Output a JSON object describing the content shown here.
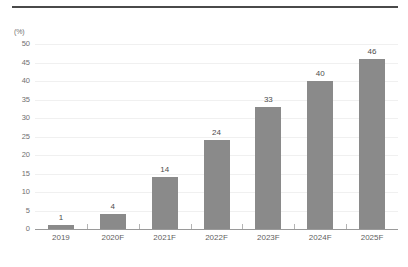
{
  "chart_data": {
    "type": "bar",
    "title": "",
    "subtitle": "",
    "xlabel": "",
    "ylabel": "(%)",
    "unit_label": "(%)",
    "categories": [
      "2019",
      "2020F",
      "2021F",
      "2022F",
      "2023F",
      "2024F",
      "2025F"
    ],
    "values": [
      1,
      4,
      14,
      24,
      33,
      40,
      46
    ],
    "value_labels": [
      "1",
      "4",
      "14",
      "24",
      "33",
      "40",
      "46"
    ],
    "ylim": [
      0,
      50
    ],
    "ytick_values": [
      0,
      5,
      10,
      15,
      20,
      25,
      30,
      35,
      40,
      45,
      50
    ],
    "ytick_labels": [
      "0",
      "5",
      "10",
      "15",
      "20",
      "25",
      "30",
      "35",
      "40",
      "45",
      "50"
    ],
    "grid": true,
    "grid_axis": "y",
    "legend": false,
    "legend_position": "none",
    "bar_color": "#8a8a8a",
    "grid_color": "#f0f0f0",
    "axis_color": "#9a9a9a",
    "text_color": "#5f5f5f",
    "rule_color": "#4a4a4a",
    "background": "#ffffff"
  }
}
